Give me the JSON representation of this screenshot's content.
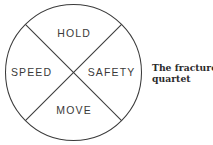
{
  "figure": {
    "name": "fracture-quartet-diagram",
    "background_color": "#ffffff",
    "stroke_color": "#3a3a3a",
    "label_color": "#3a3a3a",
    "caption_color": "#2b2b2b"
  },
  "diagram": {
    "shape": "circle-divided-into-four-quadrants-by-an-x",
    "circle": {
      "center_x": 73.5,
      "center_y": 72.5,
      "radius": 68,
      "stroke_width": 1
    },
    "dividers": [
      {
        "name": "diagonal-top-left-to-bottom-right",
        "x1": 25.4,
        "y1": 24.4,
        "x2": 121.6,
        "y2": 120.6
      },
      {
        "name": "diagonal-top-right-to-bottom-left",
        "x1": 121.6,
        "y1": 24.4,
        "x2": 25.4,
        "y2": 120.6
      }
    ],
    "quadrants": [
      {
        "position": "top",
        "label": "HOLD"
      },
      {
        "position": "left",
        "label": "SPEED"
      },
      {
        "position": "right",
        "label": "SAFETY"
      },
      {
        "position": "bottom",
        "label": "MOVE"
      }
    ]
  },
  "caption": {
    "line1": "The fracture",
    "line2": "quartet",
    "full_text": "The fracture quartet"
  }
}
